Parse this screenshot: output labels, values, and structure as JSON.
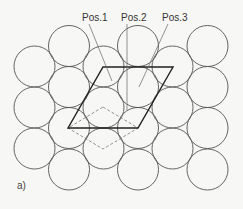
{
  "figure": {
    "type": "hexagonal close-packed sphere layer diagram",
    "caption": "a)",
    "labels": [
      {
        "id": "pos1",
        "text": "Pos.1"
      },
      {
        "id": "pos2",
        "text": "Pos.2"
      },
      {
        "id": "pos3",
        "text": "Pos.3"
      }
    ],
    "circle_count": 21,
    "elements": {
      "solid_rhombus": "unit cell outline (solid)",
      "dashed_rhombus": "alternate cell outline (dashed)"
    }
  }
}
